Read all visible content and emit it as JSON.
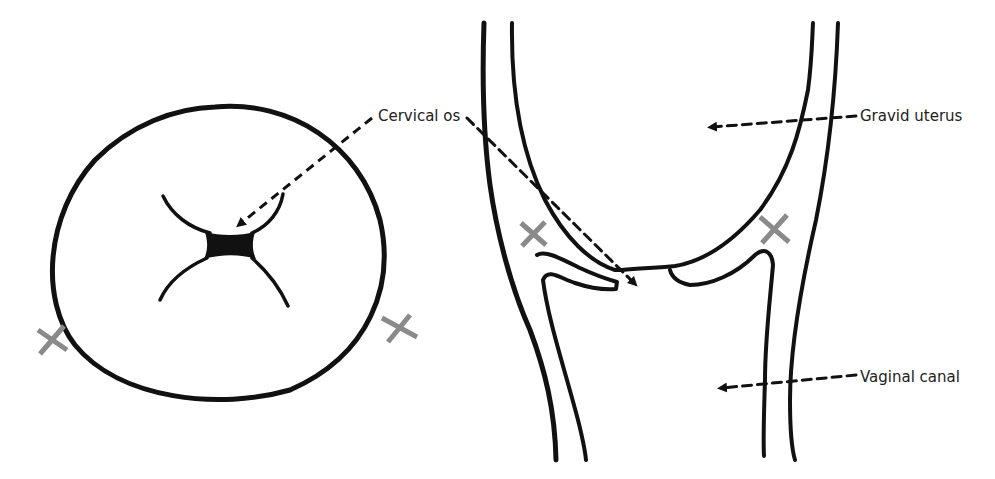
{
  "diagram": {
    "type": "anatomical illustration",
    "panels": [
      {
        "id": "left",
        "view": "cervix face-on (os opening)"
      },
      {
        "id": "right",
        "view": "sagittal section of cervix between uterus and vagina"
      }
    ],
    "labels": {
      "cervical_os": "Cervical os",
      "gravid_uterus": "Gravid uterus",
      "vaginal_canal": "Vaginal canal"
    },
    "markers": {
      "symbol": "×",
      "count": 4,
      "color": "#8a8a8a"
    },
    "colors": {
      "stroke": "#111111",
      "arrow": "#111111",
      "marker": "#8a8a8a",
      "text": "#222222",
      "background": "#ffffff"
    }
  }
}
